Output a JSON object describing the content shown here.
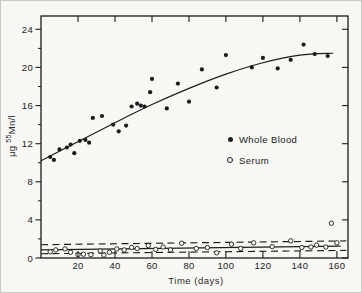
{
  "figure": {
    "background": "#f7f7f4",
    "ink": "#1c1c1c",
    "border_color": "#c9c9c3"
  },
  "chart_data": {
    "type": "scatter",
    "title": "",
    "xlabel": "Time (days)",
    "ylabel": "μg ⁵⁵Mn/l",
    "ylabel_parts": {
      "pre": "μg ",
      "sup": "55",
      "post": "Mn/l"
    },
    "xlim": [
      0,
      166
    ],
    "ylim": [
      0,
      25.4
    ],
    "x_ticks": [
      20,
      40,
      60,
      80,
      100,
      120,
      140,
      160
    ],
    "y_ticks": [
      0,
      4,
      8,
      12,
      16,
      20,
      24
    ],
    "y_minor_ticks": [
      2,
      6,
      10,
      14,
      18,
      22
    ],
    "grid": false,
    "legend_position": "middle-right",
    "legend": [
      {
        "label": "Whole Blood",
        "marker": "filled-circle"
      },
      {
        "label": "Serum",
        "marker": "open-circle"
      }
    ],
    "series": [
      {
        "name": "Whole Blood",
        "marker": "filled-circle",
        "points": [
          [
            5,
            10.6
          ],
          [
            7,
            10.3
          ],
          [
            10,
            11.4
          ],
          [
            14,
            11.6
          ],
          [
            16,
            11.9
          ],
          [
            18,
            11.0
          ],
          [
            21,
            12.3
          ],
          [
            24,
            12.4
          ],
          [
            26,
            12.1
          ],
          [
            28,
            14.7
          ],
          [
            33,
            14.9
          ],
          [
            39,
            14.0
          ],
          [
            42,
            13.3
          ],
          [
            46,
            13.9
          ],
          [
            49,
            15.9
          ],
          [
            52,
            16.2
          ],
          [
            54,
            16.0
          ],
          [
            56,
            15.9
          ],
          [
            59,
            17.4
          ],
          [
            60,
            18.8
          ],
          [
            68,
            15.7
          ],
          [
            74,
            18.3
          ],
          [
            80,
            16.4
          ],
          [
            87,
            19.8
          ],
          [
            95,
            17.9
          ],
          [
            100,
            21.3
          ],
          [
            114,
            20.0
          ],
          [
            120,
            21.0
          ],
          [
            128,
            19.9
          ],
          [
            135,
            20.8
          ],
          [
            142,
            22.4
          ],
          [
            148,
            21.4
          ],
          [
            155,
            21.2
          ]
        ]
      },
      {
        "name": "Serum",
        "marker": "open-circle",
        "points": [
          [
            5,
            0.65
          ],
          [
            8,
            0.85
          ],
          [
            13,
            0.95
          ],
          [
            16,
            0.6
          ],
          [
            20,
            0.35
          ],
          [
            23,
            0.4
          ],
          [
            27,
            0.35
          ],
          [
            32,
            0.75
          ],
          [
            34,
            0.3
          ],
          [
            37,
            0.6
          ],
          [
            41,
            0.95
          ],
          [
            45,
            0.85
          ],
          [
            49,
            1.1
          ],
          [
            52,
            1.0
          ],
          [
            58,
            1.3
          ],
          [
            62,
            0.9
          ],
          [
            66,
            1.15
          ],
          [
            70,
            0.85
          ],
          [
            76,
            1.55
          ],
          [
            84,
            1.0
          ],
          [
            90,
            1.1
          ],
          [
            95,
            0.55
          ],
          [
            103,
            1.45
          ],
          [
            108,
            1.0
          ],
          [
            115,
            1.6
          ],
          [
            125,
            1.2
          ],
          [
            135,
            1.8
          ],
          [
            141,
            1.1
          ],
          [
            146,
            1.15
          ],
          [
            149,
            1.35
          ],
          [
            154,
            1.15
          ],
          [
            157,
            3.65
          ],
          [
            160,
            1.6
          ]
        ]
      }
    ],
    "fit_curve": {
      "applies_to": "Whole Blood",
      "points": [
        [
          0,
          10.2
        ],
        [
          20,
          12.2
        ],
        [
          40,
          14.2
        ],
        [
          60,
          16.1
        ],
        [
          80,
          17.8
        ],
        [
          100,
          19.3
        ],
        [
          120,
          20.5
        ],
        [
          140,
          21.3
        ],
        [
          158,
          21.5
        ]
      ]
    },
    "reference_lines": [
      {
        "name": "serum-mean-line",
        "style": "solid",
        "points": [
          [
            0,
            0.85
          ],
          [
            162,
            1.25
          ]
        ]
      },
      {
        "name": "serum-upper-band",
        "style": "dashed",
        "points": [
          [
            0,
            1.4
          ],
          [
            165,
            1.8
          ]
        ]
      },
      {
        "name": "serum-lower-band",
        "style": "dashed",
        "points": [
          [
            0,
            0.45
          ],
          [
            165,
            0.8
          ]
        ]
      }
    ]
  }
}
